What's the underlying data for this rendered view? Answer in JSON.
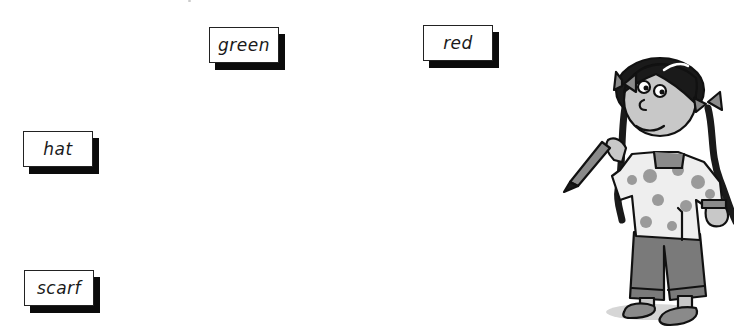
{
  "worksheet": {
    "word_cards": [
      {
        "id": "green",
        "label": "green"
      },
      {
        "id": "red",
        "label": "red"
      },
      {
        "id": "hat",
        "label": "hat"
      },
      {
        "id": "scarf",
        "label": "scarf"
      }
    ],
    "illustration": {
      "subject": "girl-holding-crayon",
      "colors": {
        "outline": "#111111",
        "skin": "#c8c8c8",
        "hair": "#1a1a1a",
        "bows": "#8c8c8c",
        "tunic": "#eeeeee",
        "tunic_pattern": "#9a9a9a",
        "trousers": "#7a7a7a",
        "shoes": "#8a8a8a"
      }
    }
  }
}
